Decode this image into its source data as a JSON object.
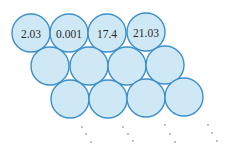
{
  "diagram": {
    "colors": {
      "fill": "#cfe8f6",
      "stroke": "#3d8fca",
      "text": "#2a2a2a",
      "dots": "#555555"
    },
    "radius": 19,
    "rows": [
      {
        "cells": [
          {
            "cx": 31,
            "cy": 33,
            "label": "2.03"
          },
          {
            "cx": 69,
            "cy": 33,
            "label": "0.001"
          },
          {
            "cx": 107,
            "cy": 33,
            "label": "17.4"
          },
          {
            "cx": 146,
            "cy": 32,
            "label": "21.03"
          }
        ]
      },
      {
        "cells": [
          {
            "cx": 50,
            "cy": 66,
            "label": ""
          },
          {
            "cx": 89,
            "cy": 66,
            "label": ""
          },
          {
            "cx": 127,
            "cy": 66,
            "label": ""
          },
          {
            "cx": 165,
            "cy": 65,
            "label": ""
          }
        ]
      },
      {
        "cells": [
          {
            "cx": 70,
            "cy": 99,
            "label": ""
          },
          {
            "cx": 108,
            "cy": 99,
            "label": ""
          },
          {
            "cx": 146,
            "cy": 98,
            "label": ""
          },
          {
            "cx": 184,
            "cy": 97,
            "label": ""
          }
        ]
      }
    ],
    "continuation_dots": [
      [
        [
          82,
          127
        ],
        [
          86,
          134
        ],
        [
          91,
          142
        ]
      ],
      [
        [
          123,
          127
        ],
        [
          128,
          134
        ],
        [
          133,
          141
        ]
      ],
      [
        [
          165,
          125
        ],
        [
          170,
          134
        ],
        [
          175,
          142
        ]
      ],
      [
        [
          208,
          125
        ],
        [
          212,
          133
        ],
        [
          217,
          141
        ]
      ]
    ]
  }
}
